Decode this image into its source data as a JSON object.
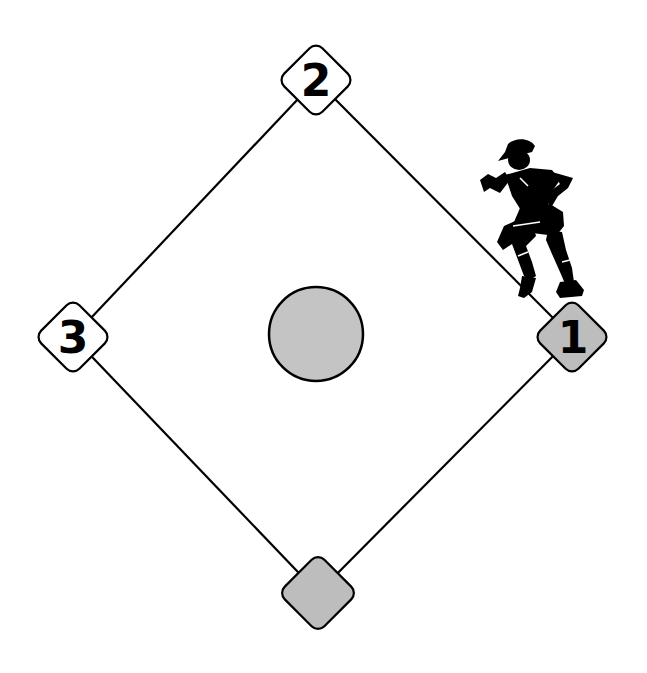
{
  "diagram": {
    "type": "baseball-infield",
    "colors": {
      "background": "#ffffff",
      "line": "#000000",
      "empty_base_fill": "#ffffff",
      "occupied_base_fill": "#bdbdbd",
      "mound_fill": "#c4c4c4",
      "runner": "#000000"
    },
    "bases": {
      "first": {
        "label": "1",
        "occupied": true
      },
      "second": {
        "label": "2",
        "occupied": false
      },
      "third": {
        "label": "3",
        "occupied": false
      },
      "home": {
        "label": "",
        "occupied": true
      }
    },
    "runner": {
      "position": "first-base",
      "description": "baseball runner silhouette"
    },
    "mound": {
      "description": "pitcher's mound"
    }
  }
}
